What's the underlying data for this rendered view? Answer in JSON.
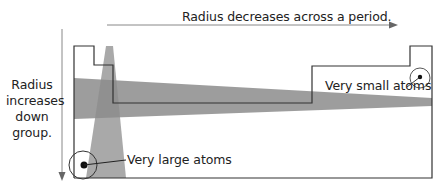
{
  "diagram": {
    "across_period_label": "Radius decreases across a period.",
    "down_group_label": "Radius increases down group.",
    "small_atoms_label": "Very small atoms",
    "large_atoms_label": "Very large atoms",
    "colors": {
      "outline": "#333333",
      "band": "#8c8c8c",
      "band_opacity": "0.85",
      "arrow": "#888888",
      "text": "#222222"
    },
    "icons": {
      "across_arrow": "arrow-right-icon",
      "down_arrow": "arrow-down-icon",
      "small_atom": "small-atom-circle-icon",
      "large_atom": "large-atom-circle-icon"
    }
  }
}
